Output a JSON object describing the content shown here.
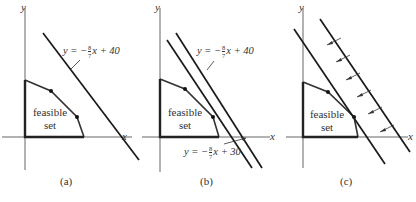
{
  "panels": [
    {
      "id": "a",
      "caption": "(a)",
      "x_axis_label": "x",
      "y_axis_label": "y",
      "region_label_line1": "feasible",
      "region_label_line2": "set",
      "lines": [
        {
          "equation_prefix": "y = −",
          "slope_num": "8",
          "slope_den": "7",
          "equation_suffix": "x + 40",
          "intercept": 40
        }
      ]
    },
    {
      "id": "b",
      "caption": "(b)",
      "x_axis_label": "x",
      "y_axis_label": "y",
      "region_label_line1": "feasible",
      "region_label_line2": "set",
      "lines": [
        {
          "equation_prefix": "y = −",
          "slope_num": "8",
          "slope_den": "7",
          "equation_suffix": "x + 40",
          "intercept": 40
        },
        {
          "equation_prefix": "y = −",
          "slope_num": "8",
          "slope_den": "7",
          "equation_suffix": "x + 30",
          "intercept": 30
        }
      ]
    },
    {
      "id": "c",
      "caption": "(c)",
      "x_axis_label": "x",
      "y_axis_label": "y",
      "region_label_line1": "feasible",
      "region_label_line2": "set",
      "arrow_count": 6,
      "arrow_direction": "down-left"
    }
  ],
  "colors": {
    "ink": "#1a1a1a",
    "axis": "#555555",
    "background": "#ffffff"
  }
}
